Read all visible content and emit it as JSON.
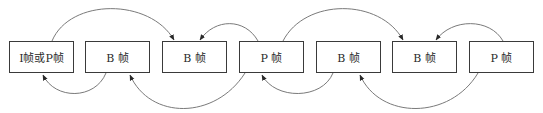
{
  "diagram": {
    "type": "frame-reference-diagram",
    "frames": [
      {
        "id": "f1",
        "label": "I帧或P帧",
        "x": 9
      },
      {
        "id": "f2",
        "label": "B 帧",
        "x": 85
      },
      {
        "id": "f3",
        "label": "B 帧",
        "x": 162
      },
      {
        "id": "f4",
        "label": "P 帧",
        "x": 239
      },
      {
        "id": "f5",
        "label": "B 帧",
        "x": 316
      },
      {
        "id": "f6",
        "label": "B 帧",
        "x": 392
      },
      {
        "id": "f7",
        "label": "P 帧",
        "x": 469
      }
    ],
    "arrows": [
      {
        "from": "f1",
        "to": "f3",
        "side": "top"
      },
      {
        "from": "f4",
        "to": "f3",
        "side": "top"
      },
      {
        "from": "f4",
        "to": "f6",
        "side": "top"
      },
      {
        "from": "f7",
        "to": "f6",
        "side": "top"
      },
      {
        "from": "f2",
        "to": "f1",
        "side": "bottom"
      },
      {
        "from": "f4",
        "to": "f2",
        "side": "bottom"
      },
      {
        "from": "f5",
        "to": "f4",
        "side": "bottom"
      },
      {
        "from": "f7",
        "to": "f5",
        "side": "bottom"
      }
    ],
    "colors": {
      "box_border": "#3a3a3a",
      "arrow": "#7a7a7a",
      "text": "#2a2a2a"
    }
  }
}
